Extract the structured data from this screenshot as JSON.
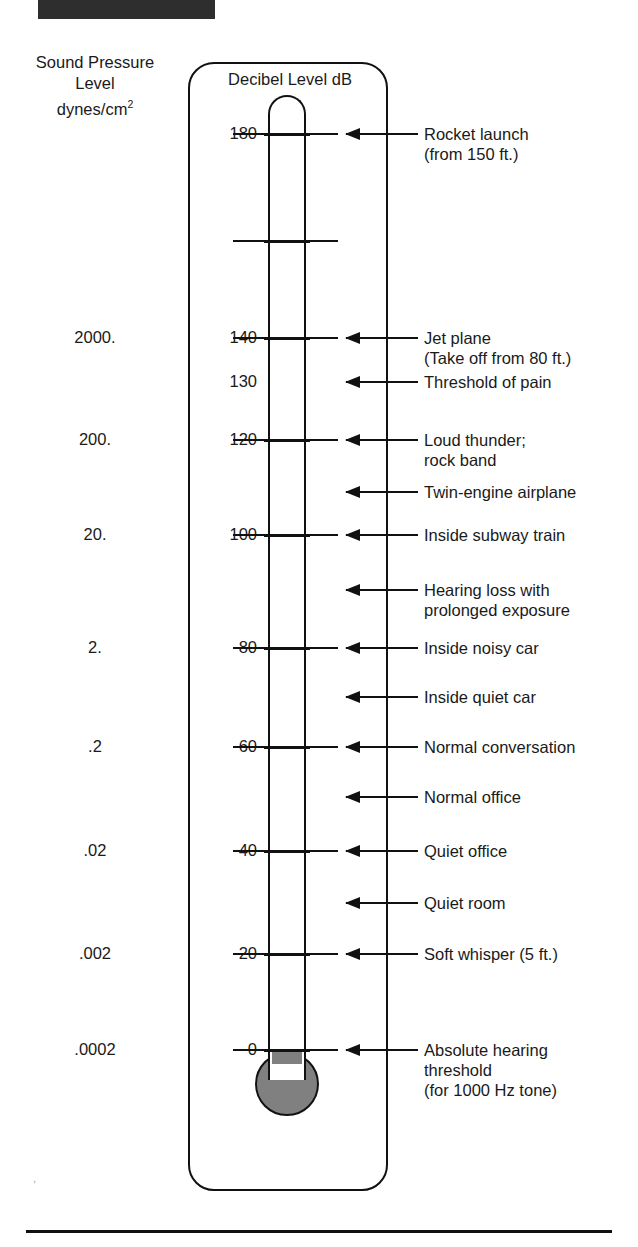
{
  "figure": {
    "top_title": "IN DECIBELS",
    "left_header_line1": "Sound Pressure",
    "left_header_line2": "Level",
    "left_header_line3": "dynes/cm",
    "left_header_sup": "2",
    "frame_title": "Decibel Level dB",
    "mercury_color": "#808080",
    "line_color": "#111111"
  },
  "chart_data": {
    "type": "bar",
    "title": "Decibel Level dB",
    "xlabel": "",
    "ylabel": "Decibel Level dB",
    "ylim": [
      0,
      190
    ],
    "grid": false,
    "legend": "none",
    "secondary_axis_label": "Sound Pressure Level dynes/cm2",
    "categories": [
      "Rocket launch (from 150 ft.)",
      "Jet plane (Take off from 80 ft.)",
      "Threshold of pain",
      "Loud thunder; rock band",
      "Twin-engine airplane",
      "Inside subway train",
      "Hearing loss with prolonged exposure",
      "Inside noisy car",
      "Inside quiet car",
      "Normal conversation",
      "Normal office",
      "Quiet office",
      "Quiet room",
      "Soft whisper (5 ft.)",
      "Absolute hearing threshold (for 1000 Hz tone)"
    ],
    "values": [
      180,
      140,
      130,
      120,
      110,
      100,
      90,
      80,
      70,
      60,
      50,
      40,
      30,
      20,
      0
    ],
    "current_reading_db": 90,
    "pressure_axis_ticks": [
      {
        "db": 140,
        "pressure": "2000."
      },
      {
        "db": 120,
        "pressure": "200."
      },
      {
        "db": 100,
        "pressure": "20."
      },
      {
        "db": 80,
        "pressure": "2."
      },
      {
        "db": 60,
        "pressure": ".2"
      },
      {
        "db": 40,
        "pressure": ".02"
      },
      {
        "db": 20,
        "pressure": ".002"
      },
      {
        "db": 0,
        "pressure": ".0002"
      }
    ]
  },
  "rows": [
    {
      "y": 134,
      "db_label": "180",
      "spl_label": "",
      "tick": "full",
      "arrow": true,
      "label_lines": [
        "Rocket launch",
        "(from 150 ft.)"
      ]
    },
    {
      "y": 241,
      "db_label": "",
      "spl_label": "",
      "tick": "full",
      "arrow": false,
      "label_lines": []
    },
    {
      "y": 338,
      "db_label": "140",
      "spl_label": "2000.",
      "tick": "full",
      "arrow": true,
      "label_lines": [
        "Jet plane",
        "(Take off from 80 ft.)"
      ]
    },
    {
      "y": 382,
      "db_label": "130",
      "spl_label": "",
      "tick": "none",
      "arrow": true,
      "label_lines": [
        "Threshold of pain"
      ]
    },
    {
      "y": 440,
      "db_label": "120",
      "spl_label": "200.",
      "tick": "full",
      "arrow": true,
      "label_lines": [
        "Loud thunder;",
        "rock band"
      ]
    },
    {
      "y": 492,
      "db_label": "",
      "spl_label": "",
      "tick": "none",
      "arrow": true,
      "label_lines": [
        "Twin-engine airplane"
      ]
    },
    {
      "y": 535,
      "db_label": "100",
      "spl_label": "20.",
      "tick": "full",
      "arrow": true,
      "label_lines": [
        "Inside subway train"
      ]
    },
    {
      "y": 590,
      "db_label": "",
      "spl_label": "",
      "tick": "none",
      "arrow": true,
      "label_lines": [
        "Hearing loss with",
        "prolonged exposure"
      ]
    },
    {
      "y": 648,
      "db_label": "80",
      "spl_label": "2.",
      "tick": "full",
      "arrow": true,
      "label_lines": [
        "Inside noisy car"
      ]
    },
    {
      "y": 697,
      "db_label": "",
      "spl_label": "",
      "tick": "none",
      "arrow": true,
      "label_lines": [
        "Inside quiet car"
      ]
    },
    {
      "y": 747,
      "db_label": "60",
      "spl_label": ".2",
      "tick": "full",
      "arrow": true,
      "label_lines": [
        "Normal conversation"
      ]
    },
    {
      "y": 797,
      "db_label": "",
      "spl_label": "",
      "tick": "none",
      "arrow": true,
      "label_lines": [
        "Normal office"
      ]
    },
    {
      "y": 851,
      "db_label": "40",
      "spl_label": ".02",
      "tick": "full",
      "arrow": true,
      "label_lines": [
        "Quiet office"
      ]
    },
    {
      "y": 903,
      "db_label": "",
      "spl_label": "",
      "tick": "none",
      "arrow": true,
      "label_lines": [
        "Quiet room"
      ]
    },
    {
      "y": 954,
      "db_label": "20",
      "spl_label": ".002",
      "tick": "full",
      "arrow": true,
      "label_lines": [
        "Soft whisper (5 ft.)"
      ]
    },
    {
      "y": 1050,
      "db_label": "0",
      "spl_label": ".0002",
      "tick": "full",
      "arrow": true,
      "label_lines": [
        "Absolute hearing",
        "threshold",
        "(for 1000 Hz tone)"
      ]
    }
  ]
}
